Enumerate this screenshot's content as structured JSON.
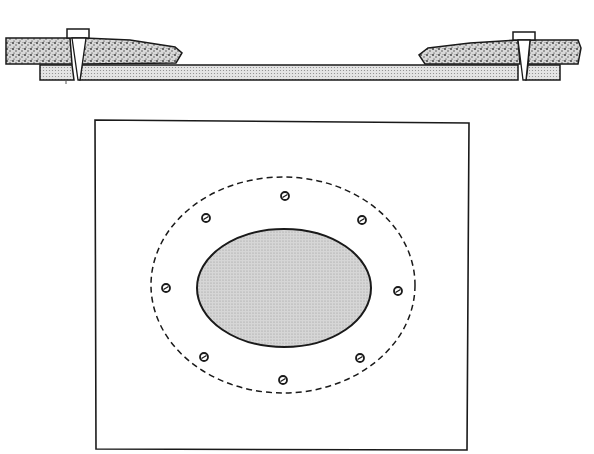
{
  "diagram": {
    "colors": {
      "background": "#ffffff",
      "stroke": "#1a1a1a",
      "stone_fill": "#cfcfcf",
      "plank_fill": "#dcdcdc",
      "patch_fill": "#d2d2d2"
    },
    "cross_section": {
      "left_board": {
        "x1": 5,
        "x2": 182,
        "y_top": 38,
        "y_bottom": 64
      },
      "right_board": {
        "x1": 418,
        "x2": 590,
        "y_top": 38,
        "y_bottom": 64
      },
      "backing_plank": {
        "x1": 40,
        "x2": 560,
        "y_top": 65,
        "y_bottom": 80
      },
      "screws": [
        {
          "name": "left-screw",
          "cx": 79
        },
        {
          "name": "right-screw",
          "cx": 524
        }
      ]
    },
    "plan_view": {
      "plate": {
        "x": 95,
        "y": 120,
        "width": 374,
        "height": 330
      },
      "outer_dashed_ellipse": {
        "cx": 283,
        "cy": 285,
        "rx": 132,
        "ry": 108
      },
      "inner_patch_ellipse": {
        "cx": 284,
        "cy": 288,
        "rx": 87,
        "ry": 59
      },
      "screws": [
        {
          "cx": 285,
          "cy": 196
        },
        {
          "cx": 206,
          "cy": 218
        },
        {
          "cx": 362,
          "cy": 220
        },
        {
          "cx": 166,
          "cy": 288
        },
        {
          "cx": 398,
          "cy": 291
        },
        {
          "cx": 204,
          "cy": 357
        },
        {
          "cx": 360,
          "cy": 358
        },
        {
          "cx": 283,
          "cy": 380
        }
      ]
    }
  }
}
